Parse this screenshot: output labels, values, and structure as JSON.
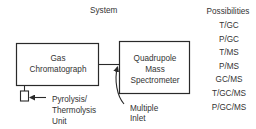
{
  "diagram": {
    "headings": {
      "system": "System",
      "possibilities": "Possibilities"
    },
    "nodes": {
      "gas_chromatograph": {
        "line1": "Gas",
        "line2": "Chromatograph"
      },
      "mass_spectrometer": {
        "line1": "Quadrupole",
        "line2": "Mass",
        "line3": "Spectrometer"
      },
      "pyrolysis_unit": {
        "line1": "Pyrolysis/",
        "line2": "Thermolysis",
        "line3": "Unit"
      },
      "multiple_inlet": {
        "line1": "Multiple",
        "line2": "Inlet"
      }
    },
    "possibilities": [
      "T/GC",
      "P/GC",
      "T/MS",
      "P/MS",
      "GC/MS",
      "T/GC/MS",
      "P/GC/MS"
    ],
    "colors": {
      "line": "#2a2a2a",
      "text": "#333333",
      "background": "#ffffff"
    }
  }
}
